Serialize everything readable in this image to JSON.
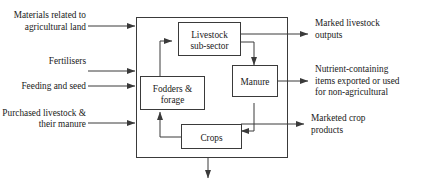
{
  "diagram": {
    "line_color": "#3a3a3a",
    "text_color": "#1a1a1a",
    "background": "#ffffff",
    "system_boundary_label": "",
    "inputs": [
      {
        "id": "materials",
        "line1": "Materials related to",
        "line2": "agricultural land"
      },
      {
        "id": "fertilisers",
        "line1": "Fertilisers",
        "line2": ""
      },
      {
        "id": "feeding-seed",
        "line1": "Feeding and seed",
        "line2": ""
      },
      {
        "id": "purchased-livestock",
        "line1": "Purchased livestock &",
        "line2": "their manure"
      }
    ],
    "outputs": [
      {
        "id": "livestock-outputs",
        "line1": "Marked livestock",
        "line2": "outputs",
        "line3": ""
      },
      {
        "id": "nutrient-items",
        "line1": "Nutrient-containing",
        "line2": "items exported or used",
        "line3": "for non-agricultural"
      },
      {
        "id": "crop-products",
        "line1": "Marketed crop",
        "line2": "products",
        "line3": ""
      }
    ],
    "nodes": [
      {
        "id": "livestock",
        "line1": "Livestock",
        "line2": "sub-sector"
      },
      {
        "id": "fodders",
        "line1": "Fodders &",
        "line2": "forage"
      },
      {
        "id": "manure",
        "line1": "Manure",
        "line2": ""
      },
      {
        "id": "crops",
        "line1": "Crops",
        "line2": ""
      }
    ],
    "bottom_output": {
      "id": "bottom-outflow",
      "label": ""
    }
  }
}
